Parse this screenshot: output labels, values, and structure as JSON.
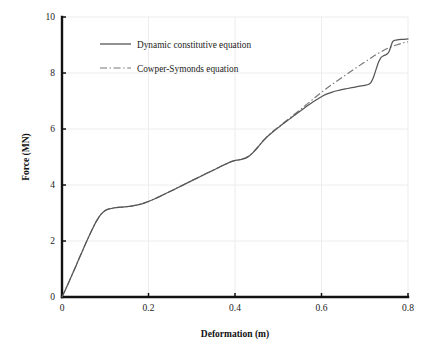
{
  "chart_data": {
    "type": "line",
    "title": "",
    "xlabel": "Deformation (m)",
    "ylabel": "Force (MN)",
    "xlim": [
      0,
      0.8
    ],
    "ylim": [
      0,
      10
    ],
    "xticks": [
      "0",
      "0.2",
      "0.4",
      "0.6",
      "0.8"
    ],
    "xtick_values": [
      0,
      0.2,
      0.4,
      0.6,
      0.8
    ],
    "yticks": [
      "0",
      "2",
      "4",
      "6",
      "8",
      "10"
    ],
    "ytick_values": [
      0,
      2,
      4,
      6,
      8,
      10
    ],
    "grid": true,
    "grid_color": "#eceaea",
    "legend_position": "upper-left-inside",
    "series": [
      {
        "name": "Dynamic constitutive equation",
        "style": "solid",
        "color": "#555555",
        "x": [
          0.0,
          0.01,
          0.02,
          0.03,
          0.04,
          0.05,
          0.06,
          0.07,
          0.08,
          0.09,
          0.1,
          0.11,
          0.12,
          0.13,
          0.14,
          0.15,
          0.16,
          0.17,
          0.18,
          0.19,
          0.2,
          0.215,
          0.23,
          0.245,
          0.26,
          0.275,
          0.29,
          0.305,
          0.32,
          0.335,
          0.35,
          0.365,
          0.38,
          0.395,
          0.405,
          0.415,
          0.425,
          0.435,
          0.445,
          0.455,
          0.465,
          0.475,
          0.49,
          0.505,
          0.52,
          0.535,
          0.55,
          0.565,
          0.58,
          0.595,
          0.61,
          0.625,
          0.64,
          0.655,
          0.67,
          0.685,
          0.7,
          0.708,
          0.714,
          0.72,
          0.726,
          0.732,
          0.738,
          0.744,
          0.75,
          0.756,
          0.765,
          0.775,
          0.785,
          0.8
        ],
        "y": [
          0.0,
          0.33,
          0.68,
          1.03,
          1.39,
          1.74,
          2.09,
          2.42,
          2.72,
          2.95,
          3.09,
          3.15,
          3.18,
          3.2,
          3.21,
          3.225,
          3.245,
          3.275,
          3.31,
          3.355,
          3.41,
          3.51,
          3.62,
          3.73,
          3.845,
          3.96,
          4.075,
          4.19,
          4.305,
          4.42,
          4.53,
          4.645,
          4.755,
          4.85,
          4.89,
          4.915,
          4.96,
          5.06,
          5.21,
          5.39,
          5.57,
          5.73,
          5.93,
          6.11,
          6.29,
          6.46,
          6.63,
          6.8,
          6.965,
          7.11,
          7.235,
          7.32,
          7.38,
          7.43,
          7.475,
          7.52,
          7.56,
          7.59,
          7.66,
          7.84,
          8.12,
          8.39,
          8.56,
          8.62,
          8.66,
          8.76,
          9.13,
          9.18,
          9.2,
          9.215
        ]
      },
      {
        "name": "Cowper-Symonds equation",
        "style": "dash-dot",
        "color": "#777777",
        "x": [
          0.0,
          0.01,
          0.02,
          0.03,
          0.04,
          0.05,
          0.06,
          0.07,
          0.08,
          0.09,
          0.1,
          0.11,
          0.12,
          0.13,
          0.14,
          0.15,
          0.16,
          0.17,
          0.18,
          0.19,
          0.2,
          0.215,
          0.23,
          0.245,
          0.26,
          0.275,
          0.29,
          0.305,
          0.32,
          0.335,
          0.35,
          0.365,
          0.38,
          0.395,
          0.405,
          0.415,
          0.425,
          0.435,
          0.445,
          0.455,
          0.465,
          0.475,
          0.49,
          0.505,
          0.52,
          0.535,
          0.55,
          0.565,
          0.58,
          0.595,
          0.61,
          0.625,
          0.64,
          0.655,
          0.67,
          0.685,
          0.7,
          0.715,
          0.73,
          0.745,
          0.76,
          0.775,
          0.79,
          0.8
        ],
        "y": [
          0.0,
          0.33,
          0.68,
          1.03,
          1.39,
          1.74,
          2.09,
          2.42,
          2.72,
          2.95,
          3.09,
          3.15,
          3.18,
          3.2,
          3.212,
          3.228,
          3.248,
          3.278,
          3.315,
          3.36,
          3.415,
          3.515,
          3.625,
          3.735,
          3.85,
          3.965,
          4.08,
          4.195,
          4.31,
          4.425,
          4.535,
          4.65,
          4.76,
          4.855,
          4.895,
          4.925,
          4.975,
          5.075,
          5.225,
          5.4,
          5.58,
          5.74,
          5.945,
          6.13,
          6.315,
          6.495,
          6.68,
          6.87,
          7.06,
          7.25,
          7.43,
          7.6,
          7.76,
          7.92,
          8.08,
          8.235,
          8.39,
          8.545,
          8.69,
          8.82,
          8.93,
          9.01,
          9.08,
          9.11
        ]
      }
    ]
  },
  "legend": {
    "entries": [
      {
        "label": "Dynamic constitutive equation",
        "style": "solid"
      },
      {
        "label": "Cowper-Symonds equation",
        "style": "dash-dot"
      }
    ]
  }
}
